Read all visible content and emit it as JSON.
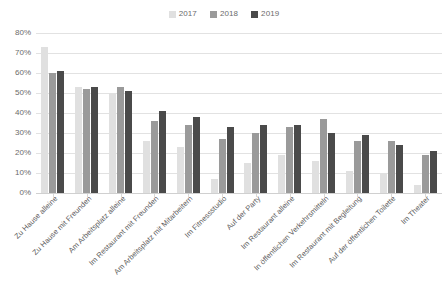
{
  "legend": {
    "position": "top-center",
    "entries": [
      {
        "label": "2017",
        "color": "#e0e0e0",
        "name": "legend-2017"
      },
      {
        "label": "2018",
        "color": "#9a9a9a",
        "name": "legend-2018"
      },
      {
        "label": "2019",
        "color": "#4a4a4a",
        "name": "legend-2019"
      }
    ]
  },
  "axis": {
    "yticks": [
      "0%",
      "10%",
      "20%",
      "30%",
      "40%",
      "50%",
      "60%",
      "70%",
      "80%"
    ],
    "ytick_values": [
      0,
      10,
      20,
      30,
      40,
      50,
      60,
      70,
      80
    ]
  },
  "chart_data": {
    "type": "bar",
    "title": "",
    "subtitle": "",
    "xlabel": "",
    "ylabel": "",
    "ylim": [
      0,
      80
    ],
    "grid": true,
    "legend_position": "top-center",
    "categories": [
      "Zu Hause alleine",
      "Zu Hause mit Freunden",
      "Am Arbeitsplatz alleine",
      "Im Restaurant mit Freunden",
      "Am Arbeitsplatz mit Mitarbeitern",
      "Im Fitnessstudio",
      "Auf der Party",
      "Im Restaurant alleine",
      "In öffentlichen Verkehrsmitteln",
      "Im Restaurant mit Begleitung",
      "Auf der öffentlichen Toilette",
      "Im Theater"
    ],
    "series": [
      {
        "name": "2017",
        "color": "#e0e0e0",
        "values": [
          73,
          53,
          50,
          26,
          23,
          7,
          15,
          19,
          16,
          11,
          10,
          4
        ]
      },
      {
        "name": "2018",
        "color": "#9a9a9a",
        "values": [
          60,
          52,
          53,
          36,
          34,
          27,
          30,
          33,
          37,
          26,
          26,
          19
        ]
      },
      {
        "name": "2019",
        "color": "#4a4a4a",
        "values": [
          61,
          53,
          51,
          41,
          38,
          33,
          34,
          34,
          30,
          29,
          24,
          21
        ]
      }
    ]
  }
}
